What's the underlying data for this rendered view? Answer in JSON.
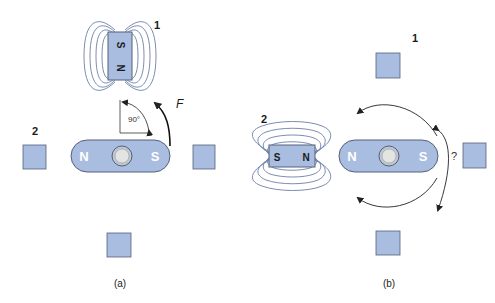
{
  "colors": {
    "magnet_fill": "#a9bde0",
    "magnet_stroke": "#56607a",
    "field_line": "#6c7fa8",
    "pivot_fill": "#d9dcd9",
    "text_dark": "#1a1a1a",
    "text_white": "#ffffff"
  },
  "panel_a": {
    "caption": "(a)",
    "magnet_1": {
      "label": "1",
      "pole_top": "S",
      "pole_bottom": "N"
    },
    "label_2": "2",
    "rotor": {
      "pole_left": "N",
      "pole_right": "S"
    },
    "angle_label": "90°",
    "force_label": "F"
  },
  "panel_b": {
    "caption": "(b)",
    "label_1": "1",
    "magnet_2": {
      "label": "2",
      "pole_left": "S",
      "pole_right": "N"
    },
    "rotor": {
      "pole_left": "N",
      "pole_right": "S"
    },
    "question_mark": "?"
  }
}
